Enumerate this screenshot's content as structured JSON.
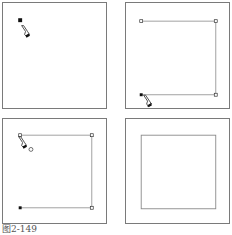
{
  "figure": {
    "caption": "图2-149",
    "panels": [
      {
        "id": "step-1",
        "description": "Pen tool places first anchor point"
      },
      {
        "id": "step-2",
        "description": "Open path with three segments, pen tool near start point to close"
      },
      {
        "id": "step-3",
        "description": "Pen tool hovering over start point showing close-path indicator"
      },
      {
        "id": "step-4",
        "description": "Closed rectangular path result"
      }
    ]
  },
  "colors": {
    "frame": "#7a7a7a",
    "path": "#888888",
    "anchor_selected": "#111111",
    "anchor_unselected": "#ffffff"
  }
}
